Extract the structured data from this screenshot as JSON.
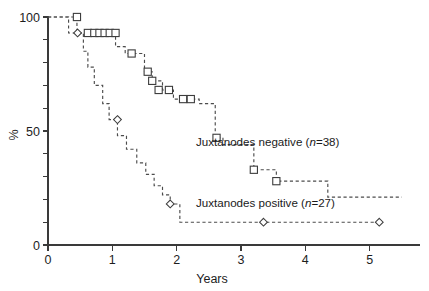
{
  "chart_data": {
    "type": "line",
    "title": "",
    "xlabel": "Years",
    "ylabel": "%",
    "xlim": [
      0,
      5.55
    ],
    "ylim": [
      0,
      100
    ],
    "xticks": [
      0,
      1,
      2,
      3,
      4,
      5
    ],
    "xtick_labels": [
      "0",
      "1",
      "2",
      "3",
      "4",
      "5"
    ],
    "yticks": [
      0,
      10,
      20,
      30,
      40,
      50,
      60,
      70,
      80,
      90,
      100
    ],
    "ytick_labels": [
      "0",
      "",
      "",
      "",
      "",
      "50",
      "",
      "",
      "",
      "",
      "100"
    ],
    "grid": false,
    "legend_position": "inside-right",
    "line_style": "dashed step",
    "series": [
      {
        "name": "Juxtanodes negative (n=38)",
        "label_plain": "Juxtanodes negative",
        "label_n": "n=38",
        "n": 38,
        "marker": "square",
        "steps": [
          [
            0.0,
            100
          ],
          [
            0.45,
            100
          ],
          [
            0.45,
            93
          ],
          [
            1.05,
            93
          ],
          [
            1.05,
            87
          ],
          [
            1.2,
            87
          ],
          [
            1.2,
            84
          ],
          [
            1.5,
            84
          ],
          [
            1.5,
            76
          ],
          [
            1.62,
            76
          ],
          [
            1.62,
            72
          ],
          [
            1.78,
            72
          ],
          [
            1.78,
            68
          ],
          [
            1.95,
            68
          ],
          [
            1.95,
            64
          ],
          [
            2.35,
            64
          ],
          [
            2.35,
            62
          ],
          [
            2.6,
            62
          ],
          [
            2.6,
            47
          ],
          [
            2.72,
            47
          ],
          [
            2.72,
            44
          ],
          [
            3.2,
            44
          ],
          [
            3.2,
            33
          ],
          [
            3.55,
            33
          ],
          [
            3.55,
            28
          ],
          [
            4.35,
            28
          ],
          [
            4.35,
            21
          ],
          [
            5.5,
            21
          ]
        ],
        "censored_points": [
          [
            0.45,
            100
          ],
          [
            0.62,
            93
          ],
          [
            0.72,
            93
          ],
          [
            0.8,
            93
          ],
          [
            0.88,
            93
          ],
          [
            0.96,
            93
          ],
          [
            1.05,
            93
          ],
          [
            1.3,
            84
          ],
          [
            1.55,
            76
          ],
          [
            1.62,
            72
          ],
          [
            1.72,
            68
          ],
          [
            1.88,
            68
          ],
          [
            2.1,
            64
          ],
          [
            2.22,
            64
          ],
          [
            2.62,
            47
          ],
          [
            3.2,
            33
          ],
          [
            3.55,
            28
          ]
        ]
      },
      {
        "name": "Juxtanodes positive (n=27)",
        "label_plain": "Juxtanodes positive",
        "label_n": "n=27",
        "n": 27,
        "marker": "diamond",
        "steps": [
          [
            0.0,
            100
          ],
          [
            0.32,
            100
          ],
          [
            0.32,
            93
          ],
          [
            0.55,
            93
          ],
          [
            0.55,
            85
          ],
          [
            0.62,
            85
          ],
          [
            0.62,
            78
          ],
          [
            0.72,
            78
          ],
          [
            0.72,
            70
          ],
          [
            0.85,
            70
          ],
          [
            0.85,
            62
          ],
          [
            0.95,
            62
          ],
          [
            0.95,
            55
          ],
          [
            1.08,
            55
          ],
          [
            1.08,
            48
          ],
          [
            1.22,
            48
          ],
          [
            1.22,
            42
          ],
          [
            1.38,
            42
          ],
          [
            1.38,
            36
          ],
          [
            1.52,
            36
          ],
          [
            1.52,
            31
          ],
          [
            1.65,
            31
          ],
          [
            1.65,
            26
          ],
          [
            1.78,
            26
          ],
          [
            1.78,
            22
          ],
          [
            1.9,
            22
          ],
          [
            1.9,
            18
          ],
          [
            2.05,
            18
          ],
          [
            2.05,
            10
          ],
          [
            5.15,
            10
          ]
        ],
        "censored_points": [
          [
            0.46,
            93
          ],
          [
            1.08,
            55
          ],
          [
            1.9,
            18
          ],
          [
            3.35,
            10
          ],
          [
            5.15,
            10
          ]
        ]
      }
    ]
  }
}
